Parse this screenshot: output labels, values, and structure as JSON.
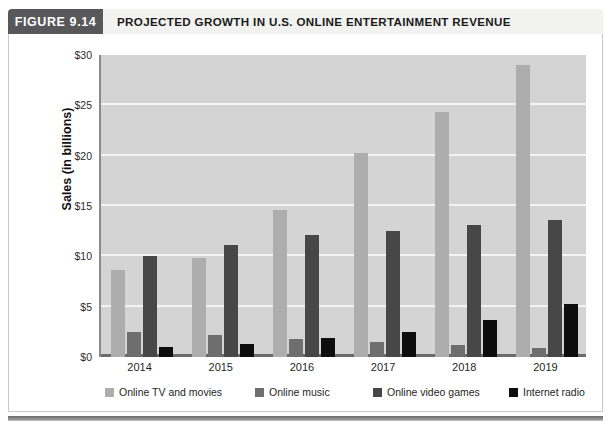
{
  "figure": {
    "tag": "FIGURE 9.14",
    "title": "PROJECTED GROWTH IN U.S. ONLINE ENTERTAINMENT REVENUE",
    "caption_sliver": ""
  },
  "colors": {
    "tag_background": "#58585a",
    "header_background": "#f2f2f0",
    "plot_background": "#d4d4d4",
    "gridline": "#f4f4f4",
    "series_online_tv_and_movies": "#adadad",
    "series_online_music": "#6e6e6e",
    "series_online_video_games": "#474747",
    "series_internet_radio": "#0d0d0d"
  },
  "chart_data": {
    "type": "bar",
    "title": "PROJECTED GROWTH IN U.S. ONLINE ENTERTAINMENT REVENUE",
    "xlabel": "",
    "ylabel": "Sales (in billions)",
    "categories": [
      "2014",
      "2015",
      "2016",
      "2017",
      "2018",
      "2019"
    ],
    "series": [
      {
        "name": "Online TV and movies",
        "values": [
          8.6,
          9.8,
          14.6,
          20.3,
          24.3,
          29.0
        ]
      },
      {
        "name": "Online music",
        "values": [
          2.5,
          2.2,
          1.8,
          1.5,
          1.2,
          0.9
        ]
      },
      {
        "name": "Online video games",
        "values": [
          10.0,
          11.1,
          12.1,
          12.5,
          13.1,
          13.6
        ]
      },
      {
        "name": "Internet radio",
        "values": [
          1.0,
          1.3,
          1.9,
          2.5,
          3.7,
          5.3
        ]
      }
    ],
    "ylim": [
      0,
      30
    ],
    "yticks": [
      0,
      5,
      10,
      15,
      20,
      25,
      30
    ],
    "ytick_labels": [
      "$0",
      "$5",
      "$10",
      "$15",
      "$20",
      "$25",
      "$30"
    ],
    "grid": true,
    "legend_position": "bottom",
    "legend_entries": [
      "Online TV and movies",
      "Online music",
      "Online video games",
      "Internet radio"
    ]
  }
}
